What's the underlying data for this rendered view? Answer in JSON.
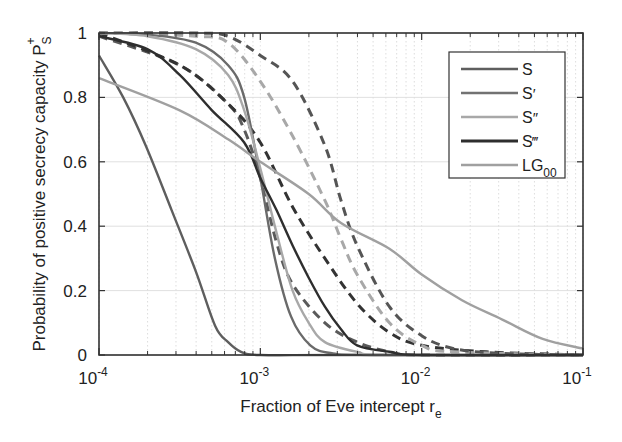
{
  "chart_data": {
    "type": "line",
    "title": "",
    "xlabel": "Fraction of Eve intercept r",
    "xlabel_sub": "e",
    "ylabel": "Probability of positive secrecy capacity P",
    "ylabel_sub": "S",
    "ylabel_sup": "+",
    "xscale": "log",
    "xlim": [
      0.0001,
      0.1
    ],
    "ylim": [
      0,
      1
    ],
    "xticks": [
      {
        "base": "10",
        "exp": "-4",
        "log": -4
      },
      {
        "base": "10",
        "exp": "-3",
        "log": -3
      },
      {
        "base": "10",
        "exp": "-2",
        "log": -2
      },
      {
        "base": "10",
        "exp": "-1",
        "log": -1
      }
    ],
    "yticks": [
      "0",
      "0.2",
      "0.4",
      "0.6",
      "0.8",
      "1"
    ],
    "grid": true,
    "legend_position": "upper right",
    "legend": [
      {
        "label": "S",
        "sup": "",
        "sub": "",
        "color": "#5e5e5e",
        "width": 2.5
      },
      {
        "label": "S",
        "sup": "′",
        "sub": "",
        "color": "#727272",
        "width": 2.5
      },
      {
        "label": "S",
        "sup": "″",
        "sub": "",
        "color": "#a8a8a8",
        "width": 2.5
      },
      {
        "label": "S",
        "sup": "‴",
        "sub": "",
        "color": "#2e2e2e",
        "width": 2.8
      },
      {
        "label": "LG",
        "sup": "",
        "sub": "00",
        "color": "#a0a0a0",
        "width": 2.5
      }
    ],
    "series": [
      {
        "name": "S",
        "style": "solid",
        "color": "#5e5e5e",
        "x_log10": [
          -4,
          -3.85,
          -3.71,
          -3.55,
          -3.4,
          -3.28,
          -3.2,
          -3.12,
          -3.0,
          -2.5,
          -1.0
        ],
        "y": [
          0.93,
          0.8,
          0.65,
          0.45,
          0.26,
          0.09,
          0.04,
          0.01,
          0.0,
          0.0,
          0.0
        ]
      },
      {
        "name": "S′",
        "style": "solid",
        "color": "#6a6a6a",
        "x_log10": [
          -4,
          -3.7,
          -3.4,
          -3.2,
          -3.1,
          -3.0,
          -2.91,
          -2.81,
          -2.69,
          -2.55,
          -2.3,
          -1.0
        ],
        "y": [
          1.0,
          0.995,
          0.97,
          0.9,
          0.8,
          0.55,
          0.3,
          0.12,
          0.03,
          0.005,
          0.0,
          0.0
        ]
      },
      {
        "name": "S″",
        "style": "solid",
        "color": "#a8a8a8",
        "x_log10": [
          -4,
          -3.7,
          -3.4,
          -3.2,
          -3.1,
          -3.0,
          -2.9,
          -2.8,
          -2.7,
          -2.6,
          -2.4,
          -2.2,
          -1.0
        ],
        "y": [
          1.0,
          0.99,
          0.95,
          0.87,
          0.76,
          0.58,
          0.38,
          0.2,
          0.1,
          0.04,
          0.01,
          0.0,
          0.0
        ]
      },
      {
        "name": "S‴",
        "style": "solid",
        "color": "#2e2e2e",
        "x_log10": [
          -4,
          -3.7,
          -3.5,
          -3.3,
          -3.1,
          -3.0,
          -2.9,
          -2.8,
          -2.7,
          -2.6,
          -2.5,
          -2.4,
          -2.2,
          -2.0,
          -1.0
        ],
        "y": [
          0.99,
          0.95,
          0.87,
          0.76,
          0.66,
          0.55,
          0.45,
          0.34,
          0.24,
          0.15,
          0.08,
          0.03,
          0.01,
          0.0,
          0.0
        ]
      },
      {
        "name": "LG00",
        "style": "solid",
        "color": "#a0a0a0",
        "x_log10": [
          -4,
          -3.5,
          -3.2,
          -3.0,
          -2.7,
          -2.5,
          -2.2,
          -2.0,
          -1.75,
          -1.5,
          -1.25,
          -1.0
        ],
        "y": [
          0.86,
          0.76,
          0.67,
          0.6,
          0.5,
          0.41,
          0.33,
          0.25,
          0.17,
          0.11,
          0.05,
          0.02
        ]
      },
      {
        "name": "S (dashed)",
        "style": "dashed",
        "color": "#5a5a5a",
        "x_log10": [
          -4,
          -3.5,
          -3.2,
          -3.1,
          -3.0,
          -2.9,
          -2.8,
          -2.6,
          -2.4,
          -2.2,
          -2.0,
          -1.0
        ],
        "y": [
          0.99,
          0.9,
          0.78,
          0.7,
          0.55,
          0.35,
          0.22,
          0.1,
          0.04,
          0.01,
          0.0,
          0.0
        ]
      },
      {
        "name": "S‴ (dashed)",
        "style": "dashed",
        "color": "#333333",
        "x_log10": [
          -4,
          -3.5,
          -3.2,
          -3.0,
          -2.8,
          -2.6,
          -2.4,
          -2.2,
          -2.0,
          -1.6,
          -1.0
        ],
        "y": [
          1.0,
          0.9,
          0.78,
          0.66,
          0.46,
          0.3,
          0.16,
          0.07,
          0.03,
          0.01,
          0.0
        ]
      },
      {
        "name": "S″ (dashed)",
        "style": "dashed",
        "color": "#a8a8a8",
        "x_log10": [
          -4,
          -3.4,
          -3.2,
          -3.0,
          -2.8,
          -2.6,
          -2.5,
          -2.4,
          -2.2,
          -2.0,
          -1.8,
          -1.0
        ],
        "y": [
          1.0,
          0.99,
          0.97,
          0.85,
          0.68,
          0.48,
          0.36,
          0.25,
          0.1,
          0.03,
          0.01,
          0.0
        ]
      },
      {
        "name": "S′ (dashed)",
        "style": "dashed",
        "color": "#555555",
        "x_log10": [
          -4,
          -3.4,
          -3.2,
          -3.0,
          -2.8,
          -2.6,
          -2.5,
          -2.4,
          -2.2,
          -2.0,
          -1.8,
          -1.5,
          -1.0
        ],
        "y": [
          1.0,
          1.0,
          0.99,
          0.93,
          0.85,
          0.65,
          0.48,
          0.34,
          0.15,
          0.06,
          0.02,
          0.005,
          0.0
        ]
      }
    ]
  }
}
